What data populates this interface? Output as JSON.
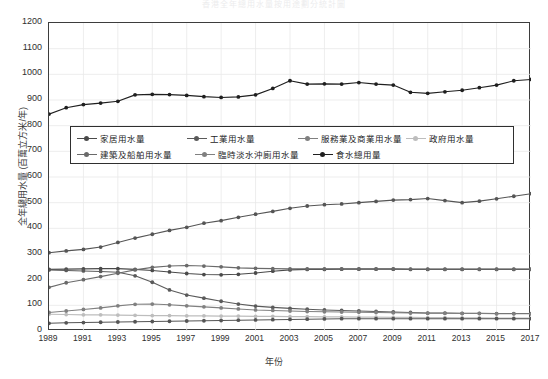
{
  "chart_data": {
    "type": "line",
    "title": "香港全年總用水量按用途劃分統計圖",
    "xlabel": "年份",
    "ylabel": "全年總用水量 (百萬立方米/年)",
    "xlim": [
      1989,
      2017
    ],
    "ylim": [
      0,
      1200
    ],
    "ytick_step": 100,
    "grid": true,
    "legend_position": "inside-upper-left",
    "x": [
      1989,
      1990,
      1991,
      1992,
      1993,
      1994,
      1995,
      1996,
      1997,
      1998,
      1999,
      2000,
      2001,
      2002,
      2003,
      2004,
      2005,
      2006,
      2007,
      2008,
      2009,
      2010,
      2011,
      2012,
      2013,
      2014,
      2015,
      2016,
      2017
    ],
    "yticks": [
      0,
      100,
      200,
      300,
      400,
      500,
      600,
      700,
      800,
      900,
      1000,
      1100,
      1200
    ],
    "xticks": [
      1989,
      1991,
      1993,
      1995,
      1997,
      1999,
      2001,
      2003,
      2005,
      2007,
      2009,
      2011,
      2013,
      2015,
      2017
    ],
    "series": [
      {
        "name": "家居用水量",
        "color": "#4a4a4a",
        "values": [
          240,
          241,
          242,
          243,
          243,
          240,
          236,
          230,
          224,
          220,
          219,
          221,
          226,
          233,
          238,
          240,
          240,
          241,
          241,
          241,
          241,
          240,
          240,
          240,
          240,
          240,
          240,
          240,
          240
        ]
      },
      {
        "name": "工業用水量",
        "color": "#5a5a5a",
        "values": [
          238,
          236,
          234,
          232,
          229,
          215,
          190,
          160,
          140,
          128,
          116,
          105,
          97,
          92,
          88,
          85,
          82,
          80,
          78,
          76,
          74,
          72,
          70,
          70,
          69,
          69,
          68,
          68,
          68
        ]
      },
      {
        "name": "服務業及商業用水量",
        "color": "#555555",
        "values": [
          305,
          312,
          318,
          327,
          345,
          362,
          377,
          392,
          404,
          420,
          430,
          443,
          455,
          466,
          478,
          487,
          492,
          495,
          500,
          505,
          510,
          512,
          516,
          508,
          500,
          506,
          515,
          525,
          535
        ]
      },
      {
        "name": "政府用水量",
        "color": "#bdbdbd",
        "values": [
          65,
          64,
          63,
          63,
          62,
          61,
          60,
          60,
          59,
          59,
          58,
          58,
          57,
          57,
          56,
          56,
          55,
          55,
          54,
          54,
          53,
          53,
          52,
          52,
          51,
          51,
          50,
          50,
          50
        ]
      },
      {
        "name": "建築及船舶用水量",
        "color": "#6a6a6a",
        "values": [
          170,
          188,
          200,
          212,
          225,
          238,
          248,
          253,
          255,
          253,
          250,
          246,
          244,
          243,
          242,
          242,
          242,
          242,
          242,
          242,
          242,
          241,
          241,
          241,
          241,
          241,
          241,
          241,
          241
        ]
      },
      {
        "name": "臨時淡水沖廁用水量",
        "color": "#808080",
        "values": [
          72,
          78,
          84,
          90,
          98,
          104,
          105,
          102,
          98,
          94,
          90,
          86,
          82,
          80,
          78,
          76,
          75,
          74,
          73,
          72,
          71,
          70,
          69,
          69,
          68,
          68,
          67,
          67,
          67
        ]
      },
      {
        "name": "食水總用量",
        "color": "#1f1f1f",
        "values": [
          845,
          870,
          882,
          888,
          895,
          920,
          922,
          921,
          918,
          913,
          910,
          912,
          920,
          945,
          975,
          962,
          963,
          962,
          968,
          962,
          958,
          930,
          926,
          932,
          938,
          948,
          958,
          975,
          980
        ]
      }
    ],
    "low_series_note": [
      {
        "name": "建築及船舶用水量-low",
        "color": "#555555",
        "values": [
          30,
          32,
          33,
          34,
          35,
          36,
          37,
          38,
          39,
          40,
          41,
          42,
          43,
          44,
          45,
          46,
          47,
          48,
          48,
          48,
          48,
          48,
          48,
          48,
          48,
          48,
          48,
          48,
          48
        ]
      }
    ]
  },
  "legend": {
    "rows": [
      [
        {
          "label": "家居用水量",
          "color": "#4a4a4a"
        },
        {
          "label": "工業用水量",
          "color": "#5a5a5a"
        },
        {
          "label": "服務業及商業用水量",
          "color": "#808080"
        },
        {
          "label": "政府用水量",
          "color": "#bdbdbd"
        }
      ],
      [
        {
          "label": "建築及船舶用水量",
          "color": "#6a6a6a"
        },
        {
          "label": "臨時淡水沖廁用水量",
          "color": "#808080"
        },
        {
          "label": "食水總用量",
          "color": "#1f1f1f"
        }
      ]
    ]
  }
}
